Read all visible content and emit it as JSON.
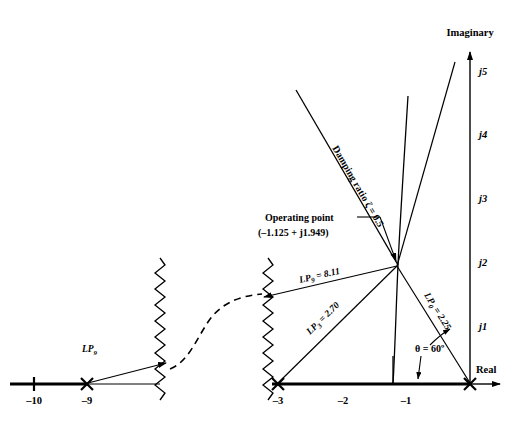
{
  "figure": {
    "title_visible": false,
    "axes": {
      "real_label": "Real",
      "imaginary_label": "Imaginary"
    },
    "left_axis": {
      "ticks": [
        {
          "label": "–10",
          "marker": "tick"
        },
        {
          "label": "–9",
          "marker": "pole-x"
        }
      ]
    },
    "right_axis": {
      "ticks": [
        {
          "label": "–3",
          "marker": "pole-x"
        },
        {
          "label": "–2",
          "marker": "tick"
        },
        {
          "label": "–1",
          "marker": "tick"
        },
        {
          "label": "",
          "marker": "pole-x"
        }
      ]
    },
    "imaginary_ticks": [
      {
        "label": "j1"
      },
      {
        "label": "j2"
      },
      {
        "label": "j3"
      },
      {
        "label": "j4"
      },
      {
        "label": "j5"
      }
    ],
    "annotations": {
      "operating_point_title": "Operating point",
      "operating_point_value": "(–1.125 + j1.949)",
      "damping_ratio": "Damping ratio ζ = 0.5",
      "theta": "θ = 60º"
    },
    "vectors": [
      {
        "name": "lp9-left",
        "label_main": "LP",
        "label_sub": "9",
        "label_value": ""
      },
      {
        "name": "lp9",
        "label_main": "LP",
        "label_sub": "9",
        "label_value": " = 8.11"
      },
      {
        "name": "lp3",
        "label_main": "LP",
        "label_sub": "3",
        "label_value": " = 2.70"
      },
      {
        "name": "lp0",
        "label_main": "LP",
        "label_sub": "0",
        "label_value": " = 2.25"
      }
    ],
    "colors": {
      "ink": "#000000",
      "background": "#ffffff"
    }
  }
}
